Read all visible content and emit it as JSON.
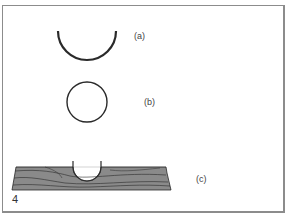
{
  "figure": {
    "number": "4",
    "panels": [
      {
        "id": "a",
        "label": "(a)",
        "description": "half-circle arc (semicircle, open at top)"
      },
      {
        "id": "b",
        "label": "(b)",
        "description": "full circle outline"
      },
      {
        "id": "c",
        "label": "(c)",
        "description": "wooden board cross-section with semicircular groove cut into top"
      }
    ]
  },
  "colors": {
    "stroke": "#2a2a2a",
    "wood_fill": "#8a8a8a",
    "frame": "#8c8c8c"
  }
}
